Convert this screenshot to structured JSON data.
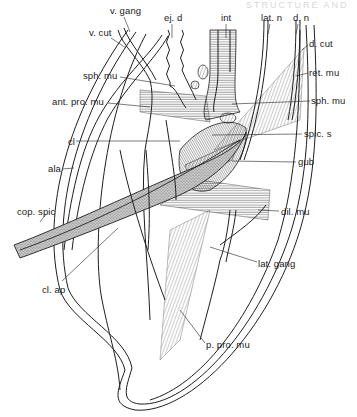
{
  "header": {
    "text": "STRUCTURE AND"
  },
  "figure": {
    "labels": [
      {
        "id": "v-gang",
        "text": "v. gang",
        "x": 110,
        "y": 6
      },
      {
        "id": "ej-d",
        "text": "ej. d",
        "x": 164,
        "y": 13
      },
      {
        "id": "int",
        "text": "int",
        "x": 221,
        "y": 13
      },
      {
        "id": "lat-n",
        "text": "lat. n",
        "x": 261,
        "y": 13
      },
      {
        "id": "d-n",
        "text": "d. n",
        "x": 293,
        "y": 13
      },
      {
        "id": "v-cut",
        "text": "v. cut",
        "x": 89,
        "y": 28
      },
      {
        "id": "d-cut",
        "text": "d. cut",
        "x": 309,
        "y": 39
      },
      {
        "id": "sph-mu-left",
        "text": "sph. mu",
        "x": 83,
        "y": 71
      },
      {
        "id": "ret-mu",
        "text": "ret. mu",
        "x": 309,
        "y": 68
      },
      {
        "id": "ant-pro-mu",
        "text": "ant. pro. mu",
        "x": 52,
        "y": 97
      },
      {
        "id": "sph-mu-right",
        "text": "sph. mu",
        "x": 311,
        "y": 96
      },
      {
        "id": "cl",
        "text": "cl",
        "x": 68,
        "y": 137
      },
      {
        "id": "spic-s",
        "text": "spic. s",
        "x": 304,
        "y": 129
      },
      {
        "id": "ala",
        "text": "ala",
        "x": 48,
        "y": 164
      },
      {
        "id": "gub",
        "text": "gub",
        "x": 298,
        "y": 157
      },
      {
        "id": "cop-spic",
        "text": "cop. spic",
        "x": 17,
        "y": 207
      },
      {
        "id": "dil-mu",
        "text": "dil. mu",
        "x": 281,
        "y": 207
      },
      {
        "id": "lat-gang",
        "text": "lat. gang",
        "x": 258,
        "y": 259
      },
      {
        "id": "cl-ap",
        "text": "cl. ap",
        "x": 42,
        "y": 285
      },
      {
        "id": "p-pro-mu",
        "text": "p. pro. mu",
        "x": 206,
        "y": 340
      }
    ]
  }
}
